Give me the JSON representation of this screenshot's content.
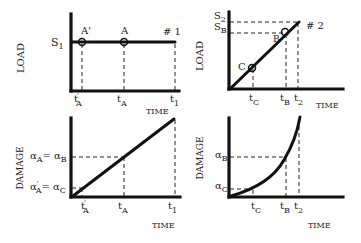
{
  "panels": {
    "top_left": {
      "ylabel": "LOAD",
      "xlabel": "TIME",
      "level_label": "S",
      "level_sub": "1",
      "curve_label": "# 1",
      "points": [
        {
          "name": "A'",
          "time_label": "t",
          "time_sub": "A",
          "time_prime": "'"
        },
        {
          "name": "A",
          "time_label": "t",
          "time_sub": "A"
        }
      ],
      "end_time_label": "t",
      "end_time_sub": "1"
    },
    "top_right": {
      "ylabel": "LOAD",
      "xlabel": "TIME",
      "levels": [
        {
          "label": "S",
          "sub": "2"
        },
        {
          "label": "S",
          "sub": "B"
        }
      ],
      "curve_label": "# 2",
      "points": [
        {
          "name": "C",
          "time_label": "t",
          "time_sub": "C"
        },
        {
          "name": "B",
          "time_label": "t",
          "time_sub": "B"
        }
      ],
      "end_time_label": "t",
      "end_time_sub": "2"
    },
    "bottom_left": {
      "ylabel": "DAMAGE",
      "xlabel": "TIME",
      "levels": [
        {
          "left": "α",
          "left_sub": "A",
          "eq": "=",
          "right": "α",
          "right_sub": "B"
        },
        {
          "left": "α",
          "left_sub": "A",
          "left_prime": "'",
          "eq": "=",
          "right": "α",
          "right_sub": "C"
        }
      ],
      "time_labels": [
        {
          "label": "t",
          "sub": "A",
          "prime": "'"
        },
        {
          "label": "t",
          "sub": "A"
        },
        {
          "label": "t",
          "sub": "1"
        }
      ]
    },
    "bottom_right": {
      "ylabel": "DAMAGE",
      "xlabel": "TIME",
      "levels": [
        {
          "label": "α",
          "sub": "B"
        },
        {
          "label": "α",
          "sub": "C"
        }
      ],
      "time_labels": [
        {
          "label": "t",
          "sub": "C"
        },
        {
          "label": "t",
          "sub": "B"
        },
        {
          "label": "t",
          "sub": "2"
        }
      ]
    }
  },
  "colors": {
    "ink": "#111111",
    "background": "#ffffff"
  }
}
